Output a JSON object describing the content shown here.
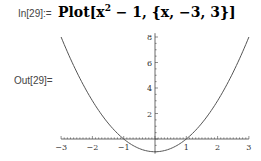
{
  "cell": {
    "in_label": "In[29]:=",
    "input_parts": {
      "head": "Plot[x",
      "exponent": "2",
      "rest": " − 1, {x, −3, 3}]"
    },
    "out_label": "Out[29]="
  },
  "chart_data": {
    "type": "line",
    "title": "",
    "function": "x^2 - 1",
    "xlabel": "",
    "ylabel": "",
    "xlim": [
      -3,
      3
    ],
    "ylim": [
      -1,
      8
    ],
    "x_ticks": [
      "-3",
      "-2",
      "-1",
      "1",
      "2",
      "3"
    ],
    "y_ticks": [
      "2",
      "4",
      "6",
      "8"
    ],
    "x": [
      -3,
      -2.5,
      -2,
      -1.5,
      -1,
      -0.5,
      0,
      0.5,
      1,
      1.5,
      2,
      2.5,
      3
    ],
    "series": [
      {
        "name": "x^2 - 1",
        "values": [
          8,
          5.25,
          3,
          1.25,
          0,
          -0.75,
          -1,
          -0.75,
          0,
          1.25,
          3,
          5.25,
          8
        ]
      }
    ],
    "grid": false,
    "legend": "none",
    "line_color": "#555555"
  }
}
